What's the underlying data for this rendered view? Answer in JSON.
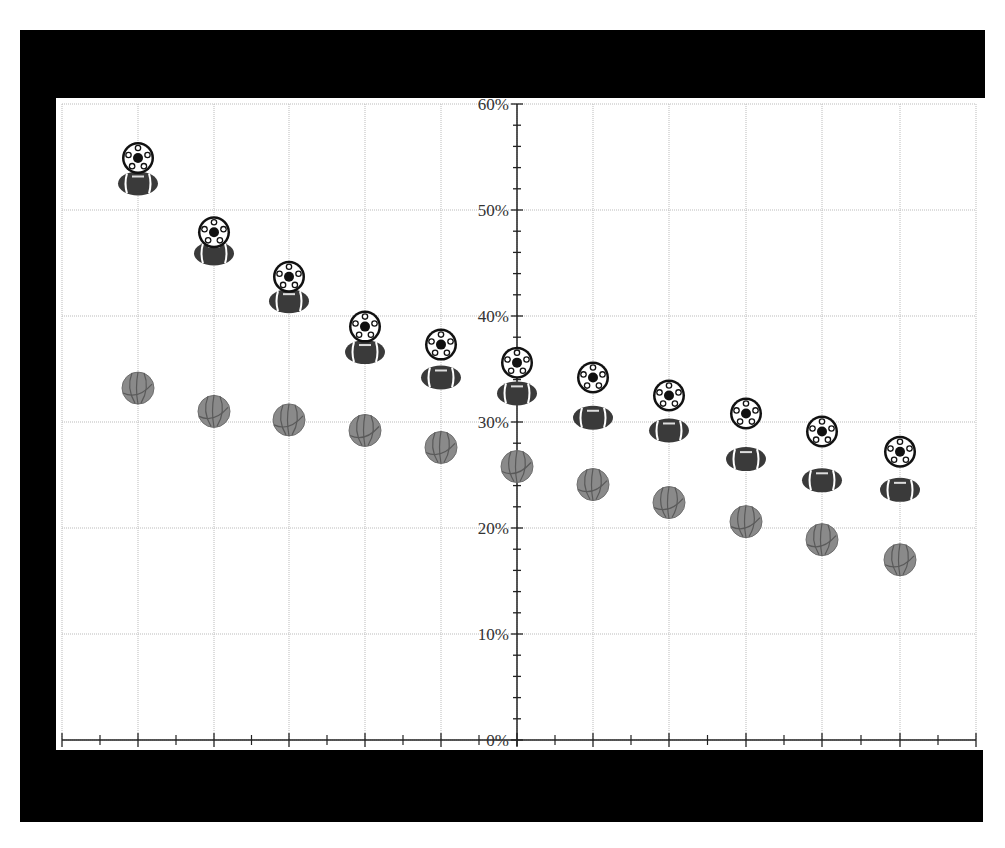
{
  "chart_data": {
    "type": "scatter",
    "title": "",
    "xlabel": "",
    "ylabel": "",
    "ylim": [
      0,
      60
    ],
    "y_ticks": [
      "0%",
      "10%",
      "20%",
      "30%",
      "40%",
      "50%",
      "60%"
    ],
    "y_minor_tick_step": 2,
    "x_tick_labels": [],
    "grid": true,
    "legend": "none",
    "marker_style": "icons",
    "categories": [
      1,
      2,
      3,
      4,
      5,
      6,
      7,
      8,
      9,
      10,
      11
    ],
    "series": [
      {
        "name": "Soccer",
        "icon": "soccer-ball-icon",
        "values": [
          54.9,
          47.9,
          43.7,
          39.0,
          37.3,
          35.6,
          34.2,
          32.5,
          30.8,
          29.1,
          27.2
        ]
      },
      {
        "name": "Football",
        "icon": "american-football-icon",
        "values": [
          52.5,
          45.9,
          41.4,
          36.6,
          34.2,
          32.7,
          30.4,
          29.2,
          26.5,
          24.5,
          23.6
        ]
      },
      {
        "name": "Basketball",
        "icon": "basketball-icon",
        "values": [
          33.2,
          31.0,
          30.2,
          29.2,
          27.6,
          25.8,
          24.1,
          22.4,
          20.6,
          18.9,
          17.0
        ]
      }
    ]
  },
  "colors": {
    "frame": "#000000",
    "background": "#ffffff",
    "axis": "#222222",
    "grid": "#bbbbbb",
    "soccer_dark": "#111111",
    "soccer_light": "#ffffff",
    "football_body": "#3a3a3a",
    "football_lace": "#dddddd",
    "basketball_fill": "#8a8a8a",
    "basketball_seam": "#555555"
  }
}
